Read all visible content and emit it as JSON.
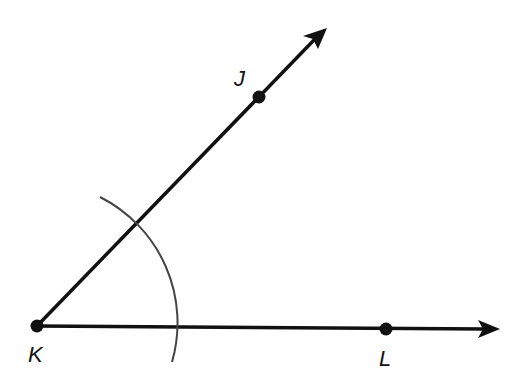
{
  "diagram": {
    "type": "geometry-angle-construction",
    "colors": {
      "stroke": "#111111",
      "arc": "#444444",
      "background": "#ffffff"
    },
    "points": [
      {
        "id": "K",
        "label": "K",
        "x": 37,
        "y": 326,
        "label_x": 28,
        "label_y": 344
      },
      {
        "id": "J",
        "label": "J",
        "x": 259,
        "y": 97,
        "label_x": 234,
        "label_y": 68
      },
      {
        "id": "L",
        "label": "L",
        "x": 386,
        "y": 329,
        "label_x": 379,
        "label_y": 348
      }
    ],
    "rays": [
      {
        "id": "ray-KJ",
        "from": "K",
        "through": "J",
        "end_x": 326,
        "end_y": 29
      },
      {
        "id": "ray-KL",
        "from": "K",
        "through": "L",
        "end_x": 500,
        "end_y": 329
      }
    ],
    "arc": {
      "center": "K",
      "start_x": 100,
      "start_y": 197,
      "end_x": 172,
      "end_y": 362,
      "radius": 141
    }
  }
}
